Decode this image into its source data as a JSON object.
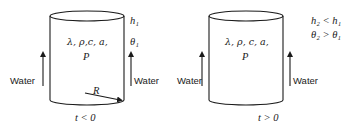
{
  "left_panel": {
    "properties_label": "λ, ρ,c, a,",
    "power_label": "P",
    "level_label": "h₁",
    "temp_label": "θ₁",
    "water_left": "Water",
    "water_right": "Water",
    "radius_label": "R",
    "time_label": "t < 0"
  },
  "right_panel": {
    "properties_label": "λ, ρ, c, a,",
    "power_label": "P",
    "level_label": "h₂ < h₁",
    "temp_label": "θ₂ > θ₁",
    "water_left": "Water",
    "water_right": "Water",
    "time_label": "t > 0"
  },
  "colors": {
    "ink": "#1a1a1a",
    "background": "#ffffff"
  }
}
